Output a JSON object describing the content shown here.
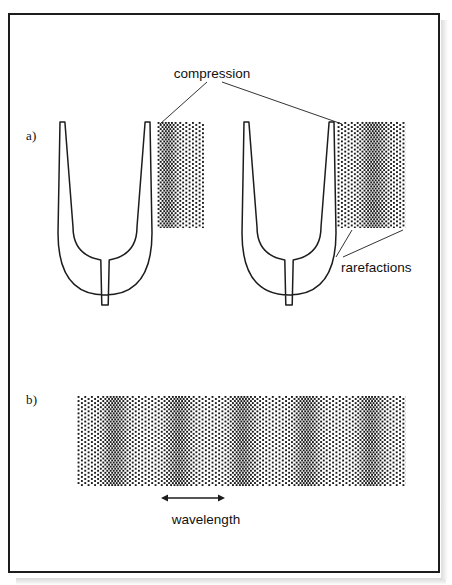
{
  "figure": {
    "background_color": "#ffffff",
    "ink_color": "#1c1c1c",
    "frame": {
      "x": 8,
      "y": 13,
      "width": 432,
      "height": 560,
      "border_px": 2
    }
  },
  "labels": {
    "panel_a": "a)",
    "panel_b": "b)",
    "compression": "compression",
    "rarefactions": "rarefactions",
    "wavelength": "wavelength"
  },
  "panel_a": {
    "forks": [
      {
        "name": "left-tuning-fork",
        "cx": 105,
        "tine_top_y": 122,
        "bottom_y": 305
      },
      {
        "name": "right-tuning-fork",
        "cx": 289,
        "tine_top_y": 122,
        "bottom_y": 305
      }
    ],
    "dot_fields": [
      {
        "name": "left-wave-field",
        "x": 157,
        "y": 122,
        "width": 47,
        "height": 106,
        "dense_bands": [
          {
            "center": 166,
            "halfwidth": 10
          }
        ]
      },
      {
        "name": "right-wave-field",
        "x": 337,
        "y": 122,
        "width": 69,
        "height": 106,
        "dense_bands": [
          {
            "center": 372,
            "halfwidth": 14
          }
        ]
      }
    ],
    "leader_lines": {
      "compression": [
        {
          "from": [
            207,
            82
          ],
          "to": [
            160,
            124
          ]
        },
        {
          "from": [
            222,
            82
          ],
          "to": [
            342,
            124
          ]
        }
      ],
      "rarefactions": [
        {
          "from": [
            336,
            257
          ],
          "to": [
            352,
            230
          ]
        },
        {
          "from": [
            343,
            257
          ],
          "to": [
            403,
            230
          ]
        }
      ]
    }
  },
  "panel_b": {
    "dot_field": {
      "name": "wave-train-field",
      "x": 77,
      "y": 396,
      "width": 329,
      "height": 90
    },
    "compression_band_centers": [
      113,
      177,
      241,
      305,
      369
    ],
    "band_halfwidth": 13,
    "wavelength_marker": {
      "x1": 161,
      "x2": 225,
      "y": 498,
      "label": "wavelength"
    }
  }
}
